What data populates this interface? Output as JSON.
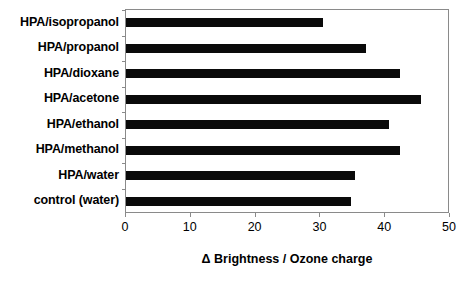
{
  "chart_data": {
    "type": "bar",
    "orientation": "horizontal",
    "title": "",
    "xlabel": "Δ Brightness /  Ozone charge",
    "ylabel": "",
    "categories": [
      "HPA/isopropanol",
      "HPA/propanol",
      "HPA/dioxane",
      "HPA/acetone",
      "HPA/ethanol",
      "HPA/methanol",
      "HPA/water",
      "control (water)"
    ],
    "values": [
      30.4,
      37.0,
      42.3,
      45.5,
      40.6,
      42.3,
      35.3,
      34.7
    ],
    "xlim": [
      0,
      50
    ],
    "xticks": [
      0,
      10,
      20,
      30,
      40,
      50
    ],
    "xtick_labels": [
      "0",
      "10",
      "20",
      "30",
      "40",
      "50"
    ],
    "grid": false,
    "legend": false,
    "bar_color": "#0a0a0a",
    "frame_color": "#8a8a8a",
    "background_color": "#ffffff"
  }
}
